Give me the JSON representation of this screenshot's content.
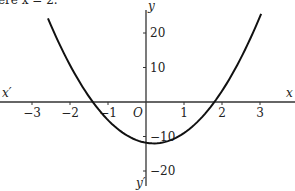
{
  "caption": "ere x = 2.",
  "chart_data": {
    "type": "line",
    "title": "",
    "xlabel": "x",
    "xlabel_neg": "x′",
    "ylabel": "y",
    "ylabel_neg": "y′",
    "origin_label": "O",
    "xlim": [
      -3.8,
      3.8
    ],
    "ylim": [
      -25,
      29
    ],
    "x_ticks": [
      -3,
      -2,
      -1,
      1,
      2,
      3
    ],
    "x_tick_labels": [
      "−3",
      "−2",
      "−1",
      "1",
      "2",
      "3"
    ],
    "y_ticks": [
      20,
      10,
      -10,
      -20
    ],
    "y_tick_labels": [
      "20",
      "10",
      "−10",
      "−20"
    ],
    "grid": false,
    "legend": "none",
    "series": [
      {
        "name": "parabola",
        "equation_estimate": "y ≈ 4.65(x − 0.2)² − 12",
        "vertex": [
          0.2,
          -12
        ],
        "x_roots": [
          -1.45,
          1.83
        ],
        "x_range": [
          -2.58,
          3.03
        ],
        "y_at_ends": [
          24.6,
          25.2
        ],
        "color": "#111111"
      }
    ]
  }
}
